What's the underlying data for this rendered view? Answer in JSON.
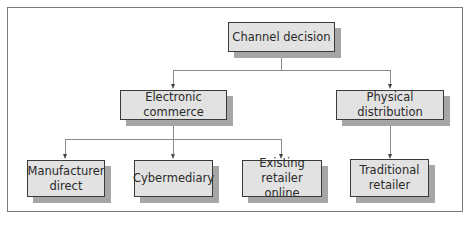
{
  "diagram": {
    "type": "tree",
    "root": {
      "label": "Channel decision"
    },
    "level1": [
      {
        "id": "electronic-commerce",
        "label": "Electronic commerce"
      },
      {
        "id": "physical-distribution",
        "label": "Physical distribution"
      }
    ],
    "level2": [
      {
        "id": "manufacturer-direct",
        "label": "Manufacturer direct",
        "parent": "electronic-commerce"
      },
      {
        "id": "cybermediary",
        "label": "Cybermediary",
        "parent": "electronic-commerce"
      },
      {
        "id": "existing-retailer-online",
        "label": "Existing retailer online",
        "parent": "electronic-commerce"
      },
      {
        "id": "traditional-retailer",
        "label": "Traditional retailer",
        "parent": "physical-distribution"
      }
    ],
    "colors": {
      "box_fill": "#e2e2e2",
      "box_border": "#3a3a3a",
      "shadow": "#a6a6a6",
      "connector": "#8a8a8a"
    }
  }
}
